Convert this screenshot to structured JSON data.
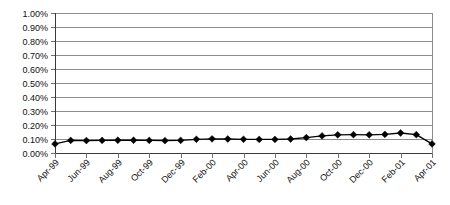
{
  "chart_data": {
    "type": "line",
    "title": "",
    "subtitle": "",
    "xlabel": "",
    "ylabel": "",
    "ylim": [
      0,
      0.01
    ],
    "grid": true,
    "legend": false,
    "legend_position": "none",
    "y_tick_labels": [
      "1.00%",
      "0.90%",
      "0.80%",
      "0.70%",
      "0.60%",
      "0.50%",
      "0.40%",
      "0.30%",
      "0.20%",
      "0.10%",
      "0.00%"
    ],
    "y_tick_values": [
      1.0,
      0.9,
      0.8,
      0.7,
      0.6,
      0.5,
      0.4,
      0.3,
      0.2,
      0.1,
      0.0
    ],
    "x_tick_labels": [
      "Apr-99",
      "Jun-99",
      "Aug-99",
      "Oct-99",
      "Dec-99",
      "Feb-00",
      "Apr-00",
      "Jun-00",
      "Aug-00",
      "Oct-00",
      "Dec-00",
      "Feb-01",
      "Apr-01"
    ],
    "x": [
      "Apr-99",
      "May-99",
      "Jun-99",
      "Jul-99",
      "Aug-99",
      "Sep-99",
      "Oct-99",
      "Nov-99",
      "Dec-99",
      "Jan-00",
      "Feb-00",
      "Mar-00",
      "Apr-00",
      "May-00",
      "Jun-00",
      "Jul-00",
      "Aug-00",
      "Sep-00",
      "Oct-00",
      "Nov-00",
      "Dec-00",
      "Jan-01",
      "Feb-01",
      "Mar-01",
      "Apr-01"
    ],
    "categories": [
      "Apr-99",
      "May-99",
      "Jun-99",
      "Jul-99",
      "Aug-99",
      "Sep-99",
      "Oct-99",
      "Nov-99",
      "Dec-99",
      "Jan-00",
      "Feb-00",
      "Mar-00",
      "Apr-00",
      "May-00",
      "Jun-00",
      "Jul-00",
      "Aug-00",
      "Sep-00",
      "Oct-00",
      "Nov-00",
      "Dec-00",
      "Jan-01",
      "Feb-01",
      "Mar-01",
      "Apr-01"
    ],
    "values": [
      0.065,
      0.09,
      0.089,
      0.09,
      0.091,
      0.091,
      0.09,
      0.088,
      0.09,
      0.098,
      0.101,
      0.1,
      0.098,
      0.097,
      0.097,
      0.1,
      0.11,
      0.122,
      0.13,
      0.131,
      0.13,
      0.133,
      0.143,
      0.131,
      0.065
    ],
    "values_unit": "percent",
    "marker": "diamond",
    "line_color": "#000000",
    "marker_color": "#000000",
    "grid_color": "#8c8c8c",
    "axis_color": "#3a3a3a",
    "background_color": "#ffffff"
  }
}
